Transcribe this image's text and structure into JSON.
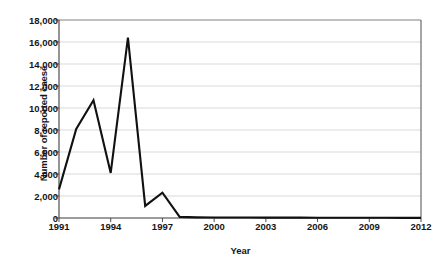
{
  "chart_data": {
    "type": "line",
    "title": "",
    "xlabel": "Year",
    "ylabel": "Number of reported caese",
    "x": [
      1991,
      1992,
      1993,
      1994,
      1995,
      1996,
      1997,
      1998,
      1999,
      2000,
      2001,
      2002,
      2003,
      2004,
      2005,
      2006,
      2007,
      2008,
      2009,
      2010,
      2011,
      2012
    ],
    "values": [
      2600,
      8100,
      10700,
      4100,
      16400,
      1100,
      2300,
      100,
      60,
      50,
      40,
      40,
      35,
      30,
      30,
      25,
      25,
      20,
      20,
      20,
      15,
      15
    ],
    "series": [
      {
        "name": "Number of reported caese",
        "values": [
          2600,
          8100,
          10700,
          4100,
          16400,
          1100,
          2300,
          100,
          60,
          50,
          40,
          40,
          35,
          30,
          30,
          25,
          25,
          20,
          20,
          20,
          15,
          15
        ]
      }
    ],
    "xlim": [
      1991,
      2012
    ],
    "ylim": [
      0,
      18000
    ],
    "xticks": [
      "1991",
      "1994",
      "1997",
      "2000",
      "2003",
      "2006",
      "2009",
      "2012"
    ],
    "xtick_values": [
      1991,
      1994,
      1997,
      2000,
      2003,
      2006,
      2009,
      2012
    ],
    "yticks": [
      "0",
      "2,000",
      "4,000",
      "6,000",
      "8,000",
      "10,000",
      "12,000",
      "14,000",
      "16,000",
      "18,000"
    ],
    "ytick_values": [
      0,
      2000,
      4000,
      6000,
      8000,
      10000,
      12000,
      14000,
      16000,
      18000
    ],
    "grid": "horizontal",
    "legend": "none",
    "line_color": "#111111",
    "grid_color": "#d9d9d9",
    "axis_color": "#4d4d4d",
    "background_color": "#ffffff"
  }
}
